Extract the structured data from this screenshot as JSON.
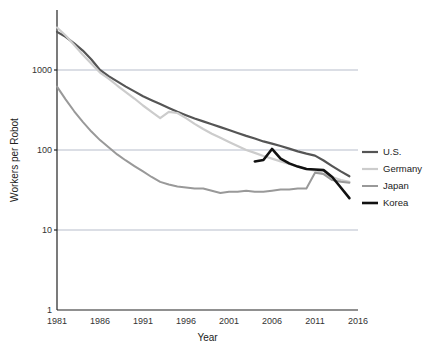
{
  "chart_data": {
    "type": "line",
    "title": "",
    "xlabel": "Year",
    "ylabel": "Workers per Robot",
    "xlim": [
      1981,
      2016
    ],
    "ylim": [
      1,
      4000
    ],
    "yscale": "log",
    "grid": true,
    "legend_position": "right",
    "xticks": [
      "1981",
      "1986",
      "1991",
      "1996",
      "2001",
      "2006",
      "2011",
      "2016"
    ],
    "yticks": [
      "1",
      "10",
      "100",
      "1000"
    ],
    "series": [
      {
        "name": "U.S.",
        "color": "#555555",
        "width": 2.2,
        "x": [
          1981,
          1982,
          1983,
          1984,
          1985,
          1986,
          1987,
          1988,
          1989,
          1990,
          1991,
          1992,
          1993,
          1994,
          1995,
          1996,
          1997,
          1998,
          1999,
          2000,
          2001,
          2002,
          2003,
          2004,
          2005,
          2006,
          2007,
          2008,
          2009,
          2010,
          2011,
          2012,
          2013,
          2014,
          2015
        ],
        "y": [
          3000,
          2600,
          2150,
          1750,
          1350,
          1000,
          840,
          720,
          620,
          540,
          470,
          420,
          375,
          335,
          300,
          272,
          248,
          228,
          210,
          193,
          178,
          163,
          150,
          139,
          128,
          120,
          112,
          104,
          96,
          90,
          85,
          74,
          63,
          54,
          47
        ]
      },
      {
        "name": "Germany",
        "color": "#cccccc",
        "width": 2.2,
        "x": [
          1981,
          1982,
          1983,
          1984,
          1985,
          1986,
          1987,
          1988,
          1989,
          1990,
          1991,
          1992,
          1993,
          1994,
          1995,
          1996,
          1997,
          1998,
          1999,
          2000,
          2001,
          2002,
          2003,
          2004,
          2005,
          2006,
          2007,
          2008,
          2009,
          2010,
          2011,
          2012,
          2013,
          2014,
          2015
        ],
        "y": [
          3400,
          2700,
          2050,
          1550,
          1200,
          930,
          780,
          640,
          530,
          440,
          360,
          300,
          250,
          300,
          290,
          250,
          212,
          183,
          160,
          142,
          126,
          112,
          100,
          92,
          84,
          78,
          72,
          67,
          62,
          58,
          55,
          50,
          46,
          42,
          40
        ]
      },
      {
        "name": "Japan",
        "color": "#999999",
        "width": 2.0,
        "x": [
          1981,
          1982,
          1983,
          1984,
          1985,
          1986,
          1987,
          1988,
          1989,
          1990,
          1991,
          1992,
          1993,
          1994,
          1995,
          1996,
          1997,
          1998,
          2000,
          2001,
          2002,
          2003,
          2004,
          2005,
          2006,
          2007,
          2008,
          2009,
          2010,
          2011,
          2012,
          2013,
          2014,
          2015
        ],
        "y": [
          620,
          430,
          305,
          225,
          170,
          133,
          108,
          88,
          74,
          63,
          54,
          46,
          40,
          37,
          35,
          34,
          33,
          33,
          29,
          30,
          30,
          31,
          30,
          30,
          31,
          32,
          32,
          33,
          33,
          52,
          50,
          42,
          40,
          39
        ]
      },
      {
        "name": "Korea",
        "color": "#111111",
        "width": 2.6,
        "x": [
          2004,
          2005,
          2006,
          2007,
          2008,
          2009,
          2010,
          2011,
          2012,
          2013,
          2014,
          2015
        ],
        "y": [
          72,
          75,
          103,
          78,
          68,
          62,
          58,
          57,
          56,
          46,
          34,
          25
        ]
      }
    ]
  },
  "legend": {
    "items": [
      {
        "label": "U.S."
      },
      {
        "label": "Germany"
      },
      {
        "label": "Japan"
      },
      {
        "label": "Korea"
      }
    ]
  }
}
